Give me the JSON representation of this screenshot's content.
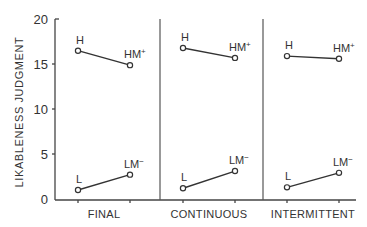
{
  "chart_data": {
    "type": "line",
    "title": "",
    "xlabel": "",
    "ylabel": "LIKABLENESS JUDGMENT",
    "ylim": [
      0,
      20
    ],
    "yticks": [
      0,
      5,
      10,
      15,
      20
    ],
    "grid": false,
    "legend": null,
    "panels": [
      {
        "category": "FINAL",
        "series": [
          {
            "name": "High",
            "points": [
              {
                "label": "H",
                "sup": "",
                "value": 16.5
              },
              {
                "label": "HM",
                "sup": "+",
                "value": 14.9
              }
            ]
          },
          {
            "name": "Low",
            "points": [
              {
                "label": "L",
                "sup": "",
                "value": 1.1
              },
              {
                "label": "LM",
                "sup": "−",
                "value": 2.8
              }
            ]
          }
        ]
      },
      {
        "category": "CONTINUOUS",
        "series": [
          {
            "name": "High",
            "points": [
              {
                "label": "H",
                "sup": "",
                "value": 16.8
              },
              {
                "label": "HM",
                "sup": "+",
                "value": 15.7
              }
            ]
          },
          {
            "name": "Low",
            "points": [
              {
                "label": "L",
                "sup": "",
                "value": 1.3
              },
              {
                "label": "LM",
                "sup": "−",
                "value": 3.2
              }
            ]
          }
        ]
      },
      {
        "category": "INTERMITTENT",
        "series": [
          {
            "name": "High",
            "points": [
              {
                "label": "H",
                "sup": "",
                "value": 15.9
              },
              {
                "label": "HM",
                "sup": "+",
                "value": 15.6
              }
            ]
          },
          {
            "name": "Low",
            "points": [
              {
                "label": "L",
                "sup": "",
                "value": 1.4
              },
              {
                "label": "LM",
                "sup": "−",
                "value": 3.0
              }
            ]
          }
        ]
      }
    ]
  },
  "axis": {
    "y_label": "LIKABLENESS JUDGMENT",
    "y_ticks": [
      "0",
      "5",
      "10",
      "15",
      "20"
    ],
    "categories": [
      "FINAL",
      "CONTINUOUS",
      "INTERMITTENT"
    ]
  }
}
